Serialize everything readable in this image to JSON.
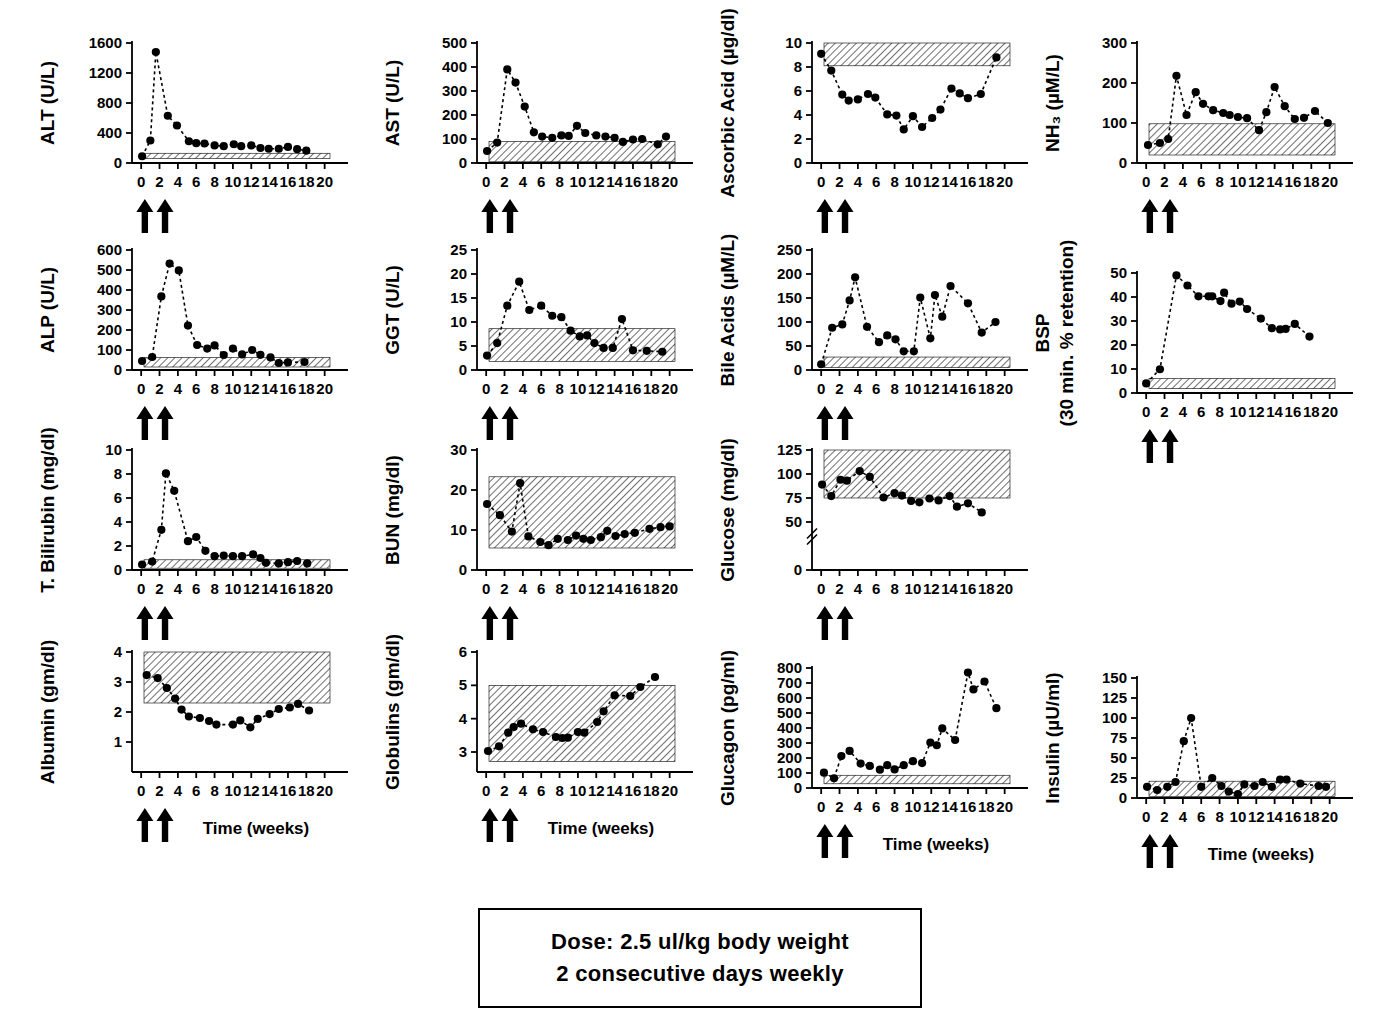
{
  "figure": {
    "dose_box": {
      "line1": "Dose: 2.5 ul/kg body weight",
      "line2": "2 consecutive days weekly"
    },
    "xaxis_title": "Time  (weeks)",
    "arrow_weeks": [
      0.4,
      2.6
    ]
  },
  "chart_data": [
    {
      "id": "alt",
      "type": "line",
      "title": "",
      "ylabel": "ALT (U/L)",
      "xlabel": "",
      "show_xlabel": false,
      "xlim": [
        -1,
        20.8
      ],
      "ylim": [
        0,
        1600
      ],
      "yticks": [
        0,
        400,
        800,
        1200,
        1600
      ],
      "xticks": [
        0,
        2,
        4,
        6,
        8,
        10,
        12,
        14,
        16,
        18,
        20
      ],
      "ref_band": [
        60,
        130
      ],
      "grid": false,
      "legend": "none",
      "x": [
        0.1,
        1.0,
        1.6,
        2.9,
        3.9,
        5.2,
        6.0,
        6.9,
        8.0,
        9.0,
        10.1,
        10.9,
        12.0,
        13.0,
        13.9,
        15.0,
        16.0,
        17.0,
        18.0
      ],
      "values": [
        90,
        300,
        1480,
        630,
        500,
        290,
        265,
        260,
        235,
        225,
        250,
        225,
        235,
        200,
        190,
        190,
        215,
        185,
        165
      ]
    },
    {
      "id": "ast",
      "type": "line",
      "ylabel": "AST (U/L)",
      "show_xlabel": false,
      "xlim": [
        -1,
        20.8
      ],
      "ylim": [
        0,
        500
      ],
      "yticks": [
        0,
        100,
        200,
        300,
        400,
        500
      ],
      "xticks": [
        0,
        2,
        4,
        6,
        8,
        10,
        12,
        14,
        16,
        18,
        20
      ],
      "ref_band": [
        5,
        90
      ],
      "x": [
        0.1,
        1.2,
        2.3,
        3.2,
        4.2,
        5.2,
        6.1,
        7.2,
        8.2,
        9.0,
        9.9,
        10.8,
        12.0,
        13.0,
        14.0,
        14.9,
        16.0,
        17.0,
        18.7,
        19.6
      ],
      "values": [
        50,
        85,
        390,
        335,
        235,
        128,
        110,
        105,
        115,
        113,
        155,
        125,
        115,
        110,
        105,
        88,
        98,
        100,
        78,
        110
      ]
    },
    {
      "id": "ascorbic",
      "type": "line",
      "ylabel": "Ascorbic Acid (µg/dl)",
      "show_xlabel": false,
      "xlim": [
        -1,
        20.8
      ],
      "ylim": [
        0,
        10
      ],
      "yticks": [
        0,
        2,
        4,
        6,
        8,
        10
      ],
      "xticks": [
        0,
        2,
        4,
        6,
        8,
        10,
        12,
        14,
        16,
        18,
        20
      ],
      "ref_band": [
        8.1,
        10.3
      ],
      "x": [
        0.0,
        1.1,
        2.3,
        3.0,
        4.0,
        5.1,
        5.9,
        7.2,
        8.2,
        9.0,
        10.0,
        11.0,
        12.1,
        13.0,
        14.2,
        15.1,
        16.0,
        17.4,
        19.1
      ],
      "values": [
        9.1,
        7.7,
        5.7,
        5.2,
        5.3,
        5.75,
        5.45,
        4.05,
        3.95,
        2.8,
        3.9,
        3.0,
        3.75,
        4.45,
        6.2,
        5.8,
        5.4,
        5.75,
        8.8
      ]
    },
    {
      "id": "nh3",
      "type": "line",
      "ylabel": "NH₃ (µM/L)",
      "show_xlabel": false,
      "xlim": [
        -1,
        20.8
      ],
      "ylim": [
        0,
        300
      ],
      "yticks": [
        0,
        100,
        200,
        300
      ],
      "xticks": [
        0,
        2,
        4,
        6,
        8,
        10,
        12,
        14,
        16,
        18,
        20
      ],
      "ref_band": [
        20,
        98
      ],
      "x": [
        0.2,
        1.5,
        2.4,
        3.3,
        4.4,
        5.4,
        6.2,
        7.3,
        8.4,
        9.1,
        10.0,
        11.0,
        12.3,
        13.1,
        14.0,
        15.1,
        16.2,
        17.2,
        18.4,
        19.8
      ],
      "values": [
        45,
        50,
        60,
        218,
        120,
        177,
        148,
        132,
        125,
        120,
        115,
        112,
        82,
        127,
        190,
        142,
        110,
        113,
        130,
        100
      ]
    },
    {
      "id": "alp",
      "type": "line",
      "ylabel": "ALP (U/L)",
      "show_xlabel": false,
      "xlim": [
        -1,
        20.8
      ],
      "ylim": [
        0,
        600
      ],
      "yticks": [
        0,
        100,
        200,
        300,
        400,
        500,
        600
      ],
      "xticks": [
        0,
        2,
        4,
        6,
        8,
        10,
        12,
        14,
        16,
        18,
        20
      ],
      "ref_band": [
        15,
        62
      ],
      "x": [
        0.1,
        1.2,
        2.2,
        3.1,
        4.1,
        5.1,
        6.1,
        7.2,
        8.0,
        9.0,
        10.0,
        11.0,
        12.1,
        13.0,
        14.1,
        15.0,
        16.0,
        17.8
      ],
      "values": [
        45,
        65,
        368,
        532,
        498,
        222,
        125,
        107,
        123,
        75,
        107,
        78,
        100,
        76,
        63,
        35,
        38,
        40
      ]
    },
    {
      "id": "ggt",
      "type": "line",
      "ylabel": "GGT (U/L)",
      "show_xlabel": false,
      "xlim": [
        -1,
        20.8
      ],
      "ylim": [
        0,
        25
      ],
      "yticks": [
        0,
        5,
        10,
        15,
        20,
        25
      ],
      "xticks": [
        0,
        2,
        4,
        6,
        8,
        10,
        12,
        14,
        16,
        18,
        20
      ],
      "ref_band": [
        1.8,
        8.6
      ],
      "x": [
        0.1,
        1.2,
        2.3,
        3.6,
        4.7,
        6.0,
        7.2,
        8.2,
        9.2,
        10.2,
        11.0,
        11.8,
        12.8,
        13.8,
        14.8,
        16.0,
        17.5,
        19.2
      ],
      "values": [
        3.0,
        5.6,
        13.4,
        18.4,
        12.5,
        13.4,
        11.3,
        11.0,
        8.2,
        7.0,
        7.2,
        5.6,
        4.6,
        4.6,
        10.6,
        4.1,
        4.0,
        3.8
      ]
    },
    {
      "id": "bile",
      "type": "line",
      "ylabel": "Bile Acids (µM/L)",
      "show_xlabel": false,
      "xlim": [
        -1,
        20.8
      ],
      "ylim": [
        0,
        250
      ],
      "yticks": [
        0,
        50,
        100,
        150,
        200,
        250
      ],
      "xticks": [
        0,
        2,
        4,
        6,
        8,
        10,
        12,
        14,
        16,
        18,
        20
      ],
      "ref_band": [
        5,
        27
      ],
      "x": [
        0.0,
        1.2,
        2.3,
        3.1,
        3.7,
        5.0,
        6.3,
        7.2,
        8.1,
        9.0,
        10.1,
        10.8,
        11.9,
        12.4,
        13.2,
        14.1,
        16.0,
        17.5,
        19.0
      ],
      "values": [
        12,
        88,
        95,
        145,
        193,
        90,
        58,
        72,
        64,
        39,
        39,
        151,
        66,
        156,
        111,
        175,
        139,
        78,
        100
      ]
    },
    {
      "id": "bsp",
      "type": "line",
      "ylabel": "BSP\n(30 min. % retention)",
      "ylabel_line1": "BSP",
      "ylabel_line2": "(30 min. % retention)",
      "show_xlabel": false,
      "xlim": [
        -1,
        20.8
      ],
      "ylim": [
        0,
        50
      ],
      "yticks": [
        0,
        10,
        20,
        30,
        40,
        50
      ],
      "xticks": [
        0,
        2,
        4,
        6,
        8,
        10,
        12,
        14,
        16,
        18,
        20
      ],
      "ref_band": [
        1.8,
        6.0
      ],
      "x": [
        0.0,
        1.5,
        3.3,
        4.5,
        5.7,
        6.8,
        7.2,
        8.1,
        8.5,
        9.3,
        10.2,
        11.0,
        12.5,
        13.7,
        14.6,
        15.2,
        16.2,
        17.8
      ],
      "values": [
        4.0,
        9.9,
        49.0,
        44.8,
        40.3,
        40.3,
        40.3,
        38.3,
        41.8,
        37.2,
        38.1,
        35.0,
        31.0,
        27.0,
        26.5,
        26.7,
        28.8,
        23.5
      ]
    },
    {
      "id": "bilirubin",
      "type": "line",
      "ylabel": "T. Bilirubin (mg/dl)",
      "show_xlabel": false,
      "xlim": [
        -1,
        20.8
      ],
      "ylim": [
        0,
        10
      ],
      "yticks": [
        0,
        2,
        4,
        6,
        8,
        10
      ],
      "xticks": [
        0,
        2,
        4,
        6,
        8,
        10,
        12,
        14,
        16,
        18,
        20
      ],
      "ref_band": [
        0.15,
        0.85
      ],
      "x": [
        0.1,
        1.2,
        2.2,
        2.7,
        3.6,
        5.1,
        6.0,
        7.0,
        8.0,
        9.0,
        10.0,
        11.0,
        12.2,
        13.0,
        13.6,
        15.0,
        16.0,
        17.0,
        18.1
      ],
      "values": [
        0.45,
        0.7,
        3.35,
        8.05,
        6.6,
        2.4,
        2.75,
        1.6,
        1.15,
        1.2,
        1.15,
        1.15,
        1.3,
        1.0,
        0.6,
        0.55,
        0.65,
        0.75,
        0.55
      ]
    },
    {
      "id": "bun",
      "type": "line",
      "ylabel": "BUN (mg/dl)",
      "show_xlabel": false,
      "xlim": [
        -1,
        20.8
      ],
      "ylim": [
        0,
        30
      ],
      "yticks": [
        0,
        10,
        20,
        30
      ],
      "xticks": [
        0,
        2,
        4,
        6,
        8,
        10,
        12,
        14,
        16,
        18,
        20
      ],
      "ref_band": [
        5.5,
        23.3
      ],
      "x": [
        0.1,
        1.5,
        2.8,
        3.7,
        4.6,
        5.9,
        6.8,
        7.8,
        8.9,
        9.8,
        10.6,
        11.4,
        12.5,
        13.2,
        14.1,
        15.1,
        16.2,
        17.8,
        19.0,
        20.0
      ],
      "values": [
        16.5,
        13.7,
        9.6,
        21.7,
        8.4,
        7.0,
        6.2,
        7.8,
        7.5,
        8.6,
        7.8,
        7.5,
        8.2,
        9.8,
        8.5,
        9.0,
        9.3,
        10.3,
        10.7,
        10.9
      ]
    },
    {
      "id": "glucose",
      "type": "line",
      "ylabel": "Glucose (mg/dl)",
      "show_xlabel": false,
      "xlim": [
        -1,
        20.8
      ],
      "ylim": [
        0,
        125
      ],
      "yticks": [
        0,
        50,
        75,
        100,
        125
      ],
      "broken_axis": true,
      "xticks": [
        0,
        2,
        4,
        6,
        8,
        10,
        12,
        14,
        16,
        18,
        20
      ],
      "ref_band": [
        75,
        125
      ],
      "x": [
        0.1,
        1.1,
        2.1,
        2.8,
        4.2,
        5.3,
        6.8,
        8.0,
        8.8,
        9.8,
        10.7,
        11.8,
        12.8,
        14.0,
        14.8,
        16.0,
        17.5
      ],
      "values": [
        89,
        77,
        94,
        93,
        103,
        97,
        75.5,
        80,
        77.5,
        72,
        70.5,
        74.5,
        72.5,
        77,
        66,
        69.5,
        60
      ]
    },
    {
      "id": "albumin",
      "type": "line",
      "ylabel": "Albumin (gm/dl)",
      "show_xlabel": true,
      "xlim": [
        -1,
        20.8
      ],
      "ylim": [
        0,
        4
      ],
      "yticks": [
        1,
        2,
        3,
        4
      ],
      "xticks": [
        0,
        2,
        4,
        6,
        8,
        10,
        12,
        14,
        16,
        18,
        20
      ],
      "ref_band": [
        2.3,
        4.0
      ],
      "x": [
        0.6,
        1.8,
        2.8,
        3.7,
        4.4,
        5.2,
        6.4,
        7.4,
        8.2,
        10.0,
        10.8,
        11.9,
        12.7,
        14.0,
        15.0,
        16.2,
        17.1,
        18.3
      ],
      "values": [
        3.23,
        3.13,
        2.8,
        2.45,
        2.08,
        1.85,
        1.8,
        1.7,
        1.58,
        1.58,
        1.72,
        1.49,
        1.77,
        1.93,
        2.1,
        2.15,
        2.27,
        2.05
      ]
    },
    {
      "id": "globulins",
      "type": "line",
      "ylabel": "Globulins (gm/dl)",
      "show_xlabel": true,
      "xlim": [
        -1,
        20.8
      ],
      "ylim": [
        2.4,
        6
      ],
      "yticks": [
        3,
        4,
        5,
        6
      ],
      "xticks": [
        0,
        2,
        4,
        6,
        8,
        10,
        12,
        14,
        16,
        18,
        20
      ],
      "ref_band": [
        2.72,
        5.0
      ],
      "x": [
        0.2,
        1.4,
        2.4,
        3.0,
        3.8,
        5.1,
        6.2,
        7.6,
        8.3,
        8.9,
        10.0,
        10.7,
        12.1,
        12.8,
        14.0,
        15.7,
        16.8,
        18.4
      ],
      "values": [
        3.03,
        3.17,
        3.58,
        3.75,
        3.85,
        3.68,
        3.6,
        3.45,
        3.42,
        3.43,
        3.6,
        3.58,
        3.9,
        4.22,
        4.7,
        4.68,
        4.95,
        5.25
      ]
    },
    {
      "id": "glucagon",
      "type": "line",
      "ylabel": "Glucagon (pg/ml)",
      "show_xlabel": true,
      "xlim": [
        -1,
        20.8
      ],
      "ylim": [
        0,
        800
      ],
      "yticks": [
        0,
        100,
        200,
        300,
        400,
        500,
        600,
        700,
        800
      ],
      "xticks": [
        0,
        2,
        4,
        6,
        8,
        10,
        12,
        14,
        16,
        18,
        20
      ],
      "ref_band": [
        28,
        85
      ],
      "x": [
        0.3,
        1.4,
        2.2,
        3.1,
        4.3,
        5.3,
        6.4,
        7.2,
        8.0,
        9.0,
        10.0,
        11.0,
        11.9,
        12.6,
        13.2,
        14.6,
        16.0,
        16.6,
        17.8,
        19.1
      ],
      "values": [
        102,
        65,
        213,
        247,
        163,
        147,
        122,
        152,
        124,
        152,
        179,
        166,
        303,
        285,
        397,
        320,
        770,
        657,
        710,
        532
      ]
    },
    {
      "id": "insulin",
      "type": "line",
      "ylabel": "Insulin (µU/ml)",
      "show_xlabel": true,
      "xlim": [
        -1,
        20.8
      ],
      "ylim": [
        0,
        150
      ],
      "yticks": [
        0,
        25,
        50,
        75,
        100,
        125,
        150
      ],
      "xticks": [
        0,
        2,
        4,
        6,
        8,
        10,
        12,
        14,
        16,
        18,
        20
      ],
      "ref_band": [
        2,
        21
      ],
      "x": [
        0.1,
        1.2,
        2.3,
        3.2,
        4.1,
        4.9,
        6.0,
        7.2,
        8.2,
        9.0,
        10.0,
        10.7,
        11.8,
        12.7,
        13.7,
        14.6,
        15.3,
        16.8,
        18.8,
        19.6
      ],
      "values": [
        14,
        10,
        14,
        20,
        71,
        100,
        14,
        25,
        15,
        8,
        5,
        17,
        15,
        20,
        14,
        23,
        23,
        18,
        15,
        14
      ]
    }
  ]
}
